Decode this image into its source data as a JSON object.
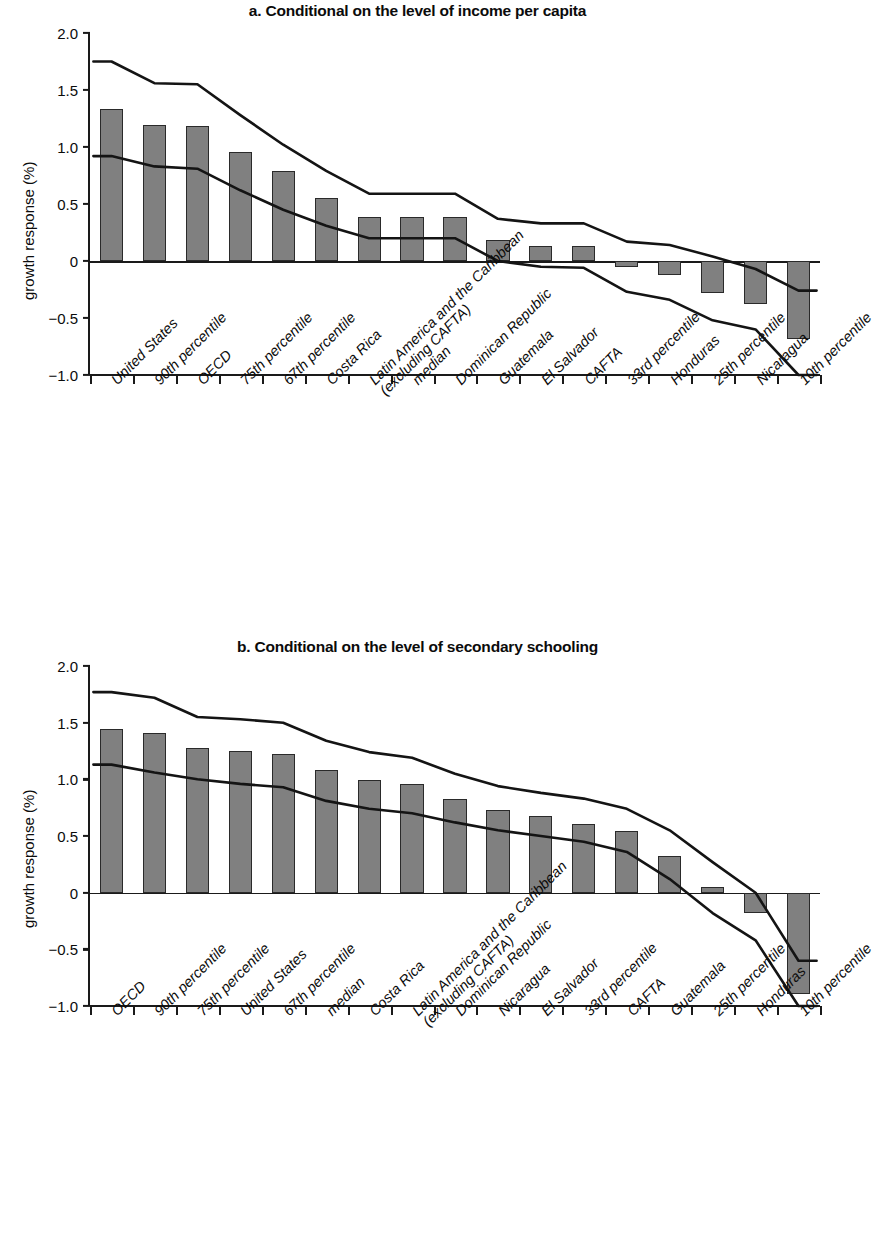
{
  "figure": {
    "ylabel": "growth response (%)"
  },
  "chart_data": [
    {
      "type": "bar",
      "panel": "a",
      "title": "a. Conditional on the level of income per capita",
      "xlabel": "",
      "ylabel": "growth response (%)",
      "ylim": [
        -1.0,
        2.0
      ],
      "yticks": [
        "2.0",
        "1.5",
        "1.0",
        "0.5",
        "0",
        "−0.5",
        "−1.0"
      ],
      "ytick_values": [
        2.0,
        1.5,
        1.0,
        0.5,
        0,
        -0.5,
        -1.0
      ],
      "grid": false,
      "legend": "none",
      "categories": [
        "United States",
        "90th percentile",
        "OECD",
        "75th percentile",
        "67th percentile",
        "Costa Rica",
        "Latin America and the Caribbean (excluding CAFTA)",
        "median",
        "Dominican Republic",
        "Guatemala",
        "El Salvador",
        "CAFTA",
        "33rd percentile",
        "Honduras",
        "25th percentile",
        "Nicaragua",
        "10th percentile"
      ],
      "values": [
        1.33,
        1.19,
        1.18,
        0.96,
        0.79,
        0.55,
        0.39,
        0.39,
        0.39,
        0.18,
        0.13,
        0.13,
        -0.05,
        -0.12,
        -0.28,
        -0.38,
        -0.68
      ],
      "series": [
        {
          "name": "upper confidence bound",
          "values": [
            1.75,
            1.56,
            1.55,
            1.28,
            1.02,
            0.79,
            0.59,
            0.59,
            0.59,
            0.37,
            0.33,
            0.33,
            0.17,
            0.14,
            0.04,
            -0.07,
            -0.26
          ]
        },
        {
          "name": "point estimate / trend",
          "values": [
            0.92,
            0.83,
            0.81,
            0.62,
            0.45,
            0.31,
            0.2,
            0.2,
            0.2,
            0.0,
            -0.05,
            -0.06,
            -0.27,
            -0.34,
            -0.52,
            -0.6,
            -1.0
          ]
        }
      ]
    },
    {
      "type": "bar",
      "panel": "b",
      "title": "b. Conditional on the level of secondary schooling",
      "xlabel": "",
      "ylabel": "growth response (%)",
      "ylim": [
        -1.0,
        2.0
      ],
      "yticks": [
        "2.0",
        "1.5",
        "1.0",
        "0.5",
        "0",
        "−0.5",
        "−1.0"
      ],
      "ytick_values": [
        2.0,
        1.5,
        1.0,
        0.5,
        0,
        -0.5,
        -1.0
      ],
      "grid": false,
      "legend": "none",
      "categories": [
        "OECD",
        "90th percentile",
        "75th percentile",
        "United States",
        "67th percentile",
        "median",
        "Costa Rica",
        "Latin America and the Caribbean (excluding CAFTA)",
        "Dominican Republic",
        "Nicaragua",
        "El Salvador",
        "33rd percentile",
        "CAFTA",
        "Guatemala",
        "25th percentile",
        "Honduras",
        "10th percentile"
      ],
      "values": [
        1.44,
        1.41,
        1.28,
        1.25,
        1.22,
        1.08,
        0.99,
        0.96,
        0.83,
        0.73,
        0.68,
        0.61,
        0.54,
        0.32,
        0.05,
        -0.18,
        -0.89
      ],
      "series": [
        {
          "name": "upper confidence bound",
          "values": [
            1.77,
            1.72,
            1.55,
            1.53,
            1.5,
            1.34,
            1.24,
            1.19,
            1.05,
            0.94,
            0.88,
            0.83,
            0.74,
            0.55,
            0.27,
            0.0,
            -0.6
          ]
        },
        {
          "name": "point estimate / trend",
          "values": [
            1.13,
            1.06,
            1.0,
            0.96,
            0.93,
            0.81,
            0.74,
            0.7,
            0.62,
            0.55,
            0.5,
            0.45,
            0.36,
            0.12,
            -0.18,
            -0.42,
            -1.0
          ]
        }
      ]
    }
  ],
  "axis_labels_a": [
    {
      "lines": [
        "United States"
      ]
    },
    {
      "lines": [
        "90th percentile"
      ]
    },
    {
      "lines": [
        "OECD"
      ]
    },
    {
      "lines": [
        "75th percentile"
      ]
    },
    {
      "lines": [
        "67th percentile"
      ]
    },
    {
      "lines": [
        "Costa Rica"
      ]
    },
    {
      "lines": [
        "Latin America and the Caribbean",
        "(excluding CAFTA)"
      ]
    },
    {
      "lines": [
        "median"
      ]
    },
    {
      "lines": [
        "Dominican Republic"
      ]
    },
    {
      "lines": [
        "Guatemala"
      ]
    },
    {
      "lines": [
        "El Salvador"
      ]
    },
    {
      "lines": [
        "CAFTA"
      ]
    },
    {
      "lines": [
        "33rd percentile"
      ]
    },
    {
      "lines": [
        "Honduras"
      ]
    },
    {
      "lines": [
        "25th percentile"
      ]
    },
    {
      "lines": [
        "Nicaragua"
      ]
    },
    {
      "lines": [
        "10th percentile"
      ]
    }
  ],
  "axis_labels_b": [
    {
      "lines": [
        "OECD"
      ]
    },
    {
      "lines": [
        "90th percentile"
      ]
    },
    {
      "lines": [
        "75th percentile"
      ]
    },
    {
      "lines": [
        "United States"
      ]
    },
    {
      "lines": [
        "67th percentile"
      ]
    },
    {
      "lines": [
        "median"
      ]
    },
    {
      "lines": [
        "Costa Rica"
      ]
    },
    {
      "lines": [
        "Latin America and the Caribbean",
        "(excluding CAFTA)"
      ]
    },
    {
      "lines": [
        "Dominican Republic"
      ]
    },
    {
      "lines": [
        "Nicaragua"
      ]
    },
    {
      "lines": [
        "El Salvador"
      ]
    },
    {
      "lines": [
        "33rd percentile"
      ]
    },
    {
      "lines": [
        "CAFTA"
      ]
    },
    {
      "lines": [
        "Guatemala"
      ]
    },
    {
      "lines": [
        "25th percentile"
      ]
    },
    {
      "lines": [
        "Honduras"
      ]
    },
    {
      "lines": [
        "10th percentile"
      ]
    }
  ],
  "colors": {
    "bar_fill": "#808080",
    "bar_stroke": "#2a2a2a",
    "line": "#141414",
    "axis": "#1a1a1a",
    "background": "#ffffff"
  }
}
